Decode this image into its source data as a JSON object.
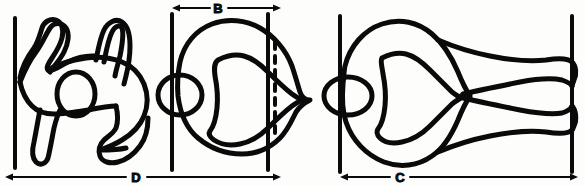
{
  "figure": {
    "background_color": "#fdfdfb",
    "ink_color": "#0a0a0a",
    "views": [
      {
        "name": "lateral-view",
        "label": "",
        "dimension": "D",
        "description": "Side view of organism with legs and central body outline"
      },
      {
        "name": "anterior-view",
        "label": "",
        "dimension": "B",
        "description": "Front view with circular head, shield outline and dashed reference line"
      },
      {
        "name": "dorsal-view",
        "label": "",
        "dimension": "C",
        "description": "Top view with shield and two posterior appendages"
      }
    ]
  },
  "dimensions": {
    "b": {
      "label": "B",
      "from_x": 172,
      "to_x": 281,
      "y": 8,
      "view": "anterior-view"
    },
    "d": {
      "label": "D",
      "from_x": 5,
      "to_x": 281,
      "y": 177,
      "view": "lateral-view"
    },
    "c": {
      "label": "C",
      "from_x": 340,
      "to_x": 578,
      "y": 177,
      "view": "dorsal-view"
    }
  },
  "reference_lines": [
    {
      "name": "left-reference-line",
      "x": 15,
      "y1": 18,
      "y2": 168,
      "style": "solid"
    },
    {
      "name": "anterior-left-reference-line",
      "x": 172,
      "y1": 14,
      "y2": 170,
      "style": "solid"
    },
    {
      "name": "anterior-right-reference-line",
      "x": 268,
      "y1": 14,
      "y2": 170,
      "style": "solid"
    },
    {
      "name": "anterior-dashed-reference-line",
      "x": 275,
      "y1": 42,
      "y2": 140,
      "style": "dashed"
    },
    {
      "name": "dorsal-left-reference-line",
      "x": 340,
      "y1": 16,
      "y2": 172,
      "style": "solid"
    },
    {
      "name": "dorsal-right-reference-line",
      "x": 572,
      "y1": 16,
      "y2": 172,
      "style": "solid"
    }
  ]
}
